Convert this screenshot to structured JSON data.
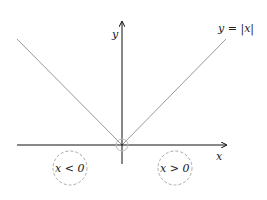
{
  "figure": {
    "function_label": "y = |x|",
    "x_axis_label": "x",
    "y_axis_label": "y",
    "left_region_label": "x < 0",
    "right_region_label": "x > 0"
  },
  "colors": {
    "axis": "#111111",
    "graph": "#999999",
    "dashed_circle": "#aaaaaa"
  }
}
